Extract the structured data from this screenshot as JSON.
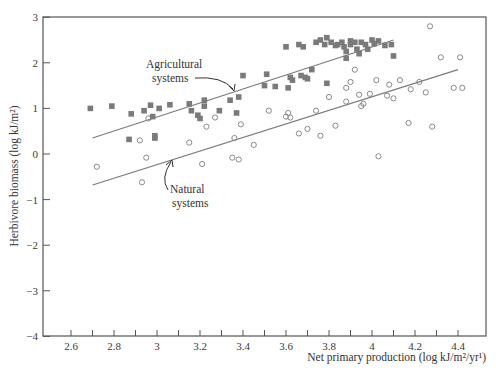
{
  "chart_data": {
    "type": "scatter",
    "title": "",
    "xlabel": "Net primary production (log kJ/m²/yr¹)",
    "ylabel": "Herbivore biomass (log kJ/m²)",
    "xlim": [
      2.47,
      4.52
    ],
    "ylim": [
      -4,
      3
    ],
    "xticks": [
      2.6,
      2.8,
      3,
      3.2,
      3.4,
      3.6,
      3.8,
      4,
      4.2,
      4.4
    ],
    "xtick_labels": [
      "2.6",
      "2.8",
      "3",
      "3.2",
      "3.4",
      "3.6",
      "3.8",
      "4",
      "4.2",
      "4.4"
    ],
    "xminor_ticks": [
      2.7,
      2.9,
      3.1,
      3.3,
      3.5,
      3.7,
      3.9,
      4.1,
      4.3
    ],
    "yticks": [
      3,
      2,
      1,
      0,
      -1,
      -2,
      -3,
      -4
    ],
    "ytick_labels": [
      "3",
      "2",
      "1",
      "0",
      "−1",
      "−2",
      "−3",
      "−4"
    ],
    "grid": false,
    "legend": "none (inline annotations)",
    "series": [
      {
        "name": "Agricultural systems",
        "marker": "filled-square",
        "color": "#7a7a7a",
        "points": [
          [
            2.69,
            1.0
          ],
          [
            2.79,
            1.05
          ],
          [
            2.87,
            0.32
          ],
          [
            2.88,
            0.88
          ],
          [
            2.94,
            0.95
          ],
          [
            2.97,
            1.07
          ],
          [
            2.98,
            0.82
          ],
          [
            2.99,
            0.4
          ],
          [
            2.99,
            0.35
          ],
          [
            3.01,
            1.0
          ],
          [
            3.06,
            1.08
          ],
          [
            3.15,
            1.1
          ],
          [
            3.16,
            0.95
          ],
          [
            3.19,
            0.85
          ],
          [
            3.2,
            0.78
          ],
          [
            3.22,
            1.18
          ],
          [
            3.22,
            1.05
          ],
          [
            3.29,
            0.95
          ],
          [
            3.34,
            1.18
          ],
          [
            3.37,
            0.9
          ],
          [
            3.38,
            1.25
          ],
          [
            3.4,
            1.72
          ],
          [
            3.5,
            1.5
          ],
          [
            3.51,
            1.75
          ],
          [
            3.55,
            1.48
          ],
          [
            3.6,
            2.35
          ],
          [
            3.61,
            1.45
          ],
          [
            3.62,
            1.68
          ],
          [
            3.63,
            1.62
          ],
          [
            3.66,
            2.4
          ],
          [
            3.67,
            1.72
          ],
          [
            3.68,
            2.35
          ],
          [
            3.69,
            1.68
          ],
          [
            3.7,
            1.65
          ],
          [
            3.72,
            1.85
          ],
          [
            3.74,
            2.45
          ],
          [
            3.76,
            2.5
          ],
          [
            3.78,
            2.4
          ],
          [
            3.79,
            2.55
          ],
          [
            3.79,
            1.55
          ],
          [
            3.81,
            2.45
          ],
          [
            3.83,
            2.38
          ],
          [
            3.84,
            2.4
          ],
          [
            3.86,
            2.45
          ],
          [
            3.87,
            2.35
          ],
          [
            3.88,
            2.25
          ],
          [
            3.88,
            2.1
          ],
          [
            3.9,
            2.48
          ],
          [
            3.9,
            2.4
          ],
          [
            3.92,
            2.45
          ],
          [
            3.93,
            2.3
          ],
          [
            3.94,
            2.2
          ],
          [
            3.95,
            2.45
          ],
          [
            3.97,
            2.4
          ],
          [
            3.98,
            2.3
          ],
          [
            4.0,
            2.5
          ],
          [
            4.01,
            2.42
          ],
          [
            4.03,
            2.48
          ],
          [
            4.06,
            2.38
          ],
          [
            4.09,
            2.4
          ],
          [
            4.1,
            2.15
          ]
        ]
      },
      {
        "name": "Natural systems",
        "marker": "open-circle",
        "color": "#8a8a8a",
        "points": [
          [
            2.72,
            -0.28
          ],
          [
            2.92,
            0.3
          ],
          [
            2.93,
            -0.62
          ],
          [
            2.95,
            -0.08
          ],
          [
            2.96,
            0.78
          ],
          [
            3.15,
            0.25
          ],
          [
            3.21,
            -0.22
          ],
          [
            3.23,
            0.6
          ],
          [
            3.27,
            0.8
          ],
          [
            3.35,
            -0.08
          ],
          [
            3.36,
            0.35
          ],
          [
            3.38,
            -0.12
          ],
          [
            3.39,
            0.65
          ],
          [
            3.45,
            0.2
          ],
          [
            3.52,
            0.95
          ],
          [
            3.6,
            0.82
          ],
          [
            3.61,
            0.9
          ],
          [
            3.62,
            0.8
          ],
          [
            3.66,
            0.45
          ],
          [
            3.7,
            0.55
          ],
          [
            3.74,
            0.95
          ],
          [
            3.76,
            0.4
          ],
          [
            3.8,
            1.25
          ],
          [
            3.83,
            0.62
          ],
          [
            3.88,
            1.45
          ],
          [
            3.88,
            1.15
          ],
          [
            3.9,
            1.58
          ],
          [
            3.92,
            1.85
          ],
          [
            3.94,
            1.3
          ],
          [
            3.95,
            1.05
          ],
          [
            3.96,
            1.1
          ],
          [
            3.99,
            1.32
          ],
          [
            4.02,
            1.62
          ],
          [
            4.03,
            -0.05
          ],
          [
            4.07,
            1.28
          ],
          [
            4.08,
            1.52
          ],
          [
            4.1,
            1.22
          ],
          [
            4.13,
            1.62
          ],
          [
            4.17,
            0.68
          ],
          [
            4.18,
            1.42
          ],
          [
            4.22,
            1.58
          ],
          [
            4.25,
            1.35
          ],
          [
            4.27,
            2.8
          ],
          [
            4.28,
            0.6
          ],
          [
            4.32,
            2.12
          ],
          [
            4.38,
            1.45
          ],
          [
            4.41,
            2.12
          ],
          [
            4.42,
            1.45
          ]
        ]
      }
    ],
    "regression_lines": [
      {
        "name": "Agricultural systems fit",
        "from": [
          2.7,
          0.35
        ],
        "to": [
          4.1,
          2.5
        ]
      },
      {
        "name": "Natural systems fit",
        "from": [
          2.7,
          -0.68
        ],
        "to": [
          4.4,
          1.85
        ]
      }
    ],
    "annotations": [
      {
        "text_lines": [
          "Agricultural",
          "systems"
        ],
        "pointer_to": [
          3.47,
          2.12
        ]
      },
      {
        "text_lines": [
          "Natural",
          "systems"
        ],
        "pointer_to": [
          3.07,
          -0.2
        ]
      }
    ]
  }
}
